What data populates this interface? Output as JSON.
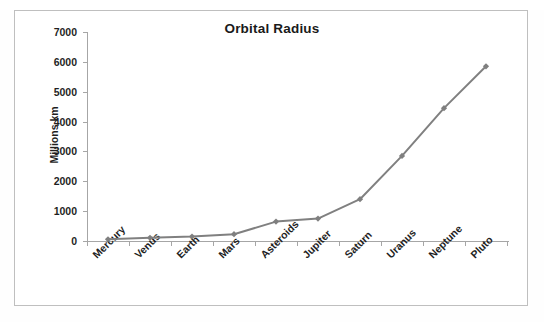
{
  "chart_data": {
    "type": "line",
    "title": "Orbital Radius",
    "xlabel": "",
    "ylabel": "Millions km",
    "categories": [
      "Mercury",
      "Venus",
      "Earth",
      "Mars",
      "Asteroids",
      "Jupiter",
      "Saturn",
      "Uranus",
      "Neptune",
      "Pluto"
    ],
    "values": [
      58,
      108,
      150,
      228,
      650,
      750,
      1400,
      2850,
      4450,
      5850
    ],
    "series": [
      {
        "name": "Orbital Radius",
        "values": [
          58,
          108,
          150,
          228,
          650,
          750,
          1400,
          2850,
          4450,
          5850
        ]
      }
    ],
    "ylim": [
      0,
      7000
    ],
    "ytick_values": [
      0,
      1000,
      2000,
      3000,
      4000,
      5000,
      6000,
      7000
    ],
    "ytick_labels": [
      "0",
      "1000",
      "2000",
      "3000",
      "4000",
      "5000",
      "6000",
      "7000"
    ],
    "grid": false,
    "legend": false,
    "legend_position": "none",
    "marker": "diamond",
    "line_color": "#808080",
    "marker_color": "#7f7f7f",
    "axis_color": "#a6a6a6",
    "text_color": "#1f1f1f",
    "xtick_label_rotation": -45
  }
}
